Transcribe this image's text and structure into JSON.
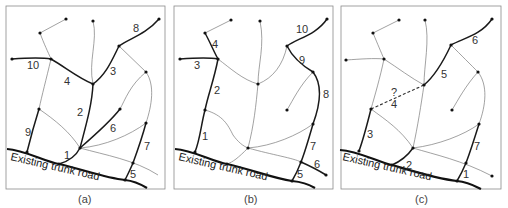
{
  "figure": {
    "road_label": "Existing trunk road",
    "panels": [
      {
        "id": "a",
        "caption": "(a)",
        "segment_labels": [
          "1",
          "2",
          "3",
          "4",
          "5",
          "6",
          "7",
          "8",
          "9",
          "10"
        ]
      },
      {
        "id": "b",
        "caption": "(b)",
        "segment_labels": [
          "1",
          "2",
          "3",
          "4",
          "5",
          "6",
          "7",
          "8",
          "9",
          "10"
        ]
      },
      {
        "id": "c",
        "caption": "(c)",
        "segment_labels": [
          "1",
          "2",
          "3",
          "?",
          "4",
          "5",
          "6",
          "7"
        ]
      }
    ]
  },
  "colors": {
    "background": "#ffffff",
    "frame": "#8a8a8a",
    "thin_line": "#7a7a7a",
    "thick_line": "#1a1a1a"
  }
}
